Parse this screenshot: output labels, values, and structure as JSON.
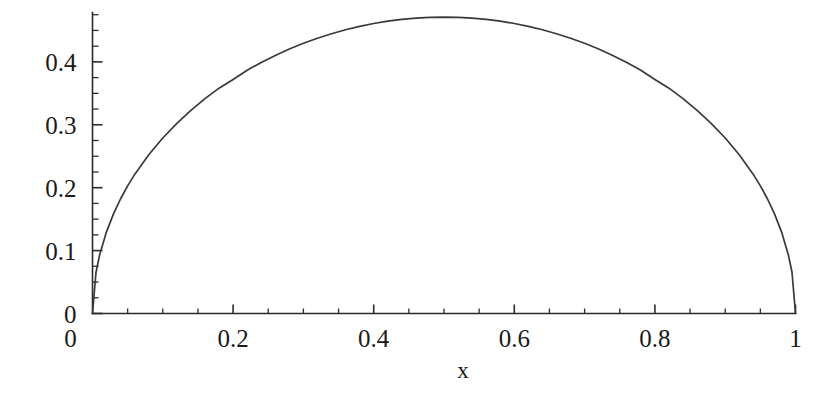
{
  "chart_data": {
    "type": "line",
    "title": "",
    "subtitle": "",
    "xlabel": "x",
    "ylabel": "",
    "xlim": [
      0,
      1
    ],
    "ylim": [
      0,
      0.475
    ],
    "grid": false,
    "legend": null,
    "x_ticks": [
      {
        "value": 0,
        "label": "0"
      },
      {
        "value": 0.2,
        "label": "0.2"
      },
      {
        "value": 0.4,
        "label": "0.4"
      },
      {
        "value": 0.6,
        "label": "0.6"
      },
      {
        "value": 0.8,
        "label": "0.8"
      },
      {
        "value": 1,
        "label": "1"
      }
    ],
    "y_ticks": [
      {
        "value": 0,
        "label": "0"
      },
      {
        "value": 0.1,
        "label": "0.1"
      },
      {
        "value": 0.2,
        "label": "0.2"
      },
      {
        "value": 0.3,
        "label": "0.3"
      },
      {
        "value": 0.4,
        "label": "0.4"
      }
    ],
    "x_minor_step": 0.05,
    "y_minor_step": 0.025,
    "series": [
      {
        "name": "curve",
        "color": "#3a3a3a",
        "x": [
          0,
          0.005,
          0.01,
          0.02,
          0.03,
          0.04,
          0.05,
          0.06,
          0.08,
          0.1,
          0.12,
          0.14,
          0.16,
          0.18,
          0.2,
          0.22,
          0.24,
          0.26,
          0.28,
          0.3,
          0.32,
          0.34,
          0.36,
          0.38,
          0.4,
          0.42,
          0.44,
          0.46,
          0.48,
          0.5,
          0.52,
          0.54,
          0.56,
          0.58,
          0.6,
          0.62,
          0.64,
          0.66,
          0.68,
          0.7,
          0.72,
          0.74,
          0.76,
          0.78,
          0.8,
          0.82,
          0.84,
          0.86,
          0.88,
          0.9,
          0.92,
          0.94,
          0.95,
          0.96,
          0.97,
          0.98,
          0.99,
          0.995,
          1
        ],
        "y": [
          0,
          0.0656,
          0.0925,
          0.1302,
          0.1587,
          0.1824,
          0.2029,
          0.2211,
          0.2523,
          0.279,
          0.3023,
          0.323,
          0.3415,
          0.3582,
          0.372,
          0.3867,
          0.3991,
          0.4103,
          0.4204,
          0.4295,
          0.4376,
          0.4448,
          0.4511,
          0.4565,
          0.461,
          0.4647,
          0.4676,
          0.4697,
          0.4709,
          0.4713,
          0.4709,
          0.4697,
          0.4676,
          0.4647,
          0.461,
          0.4565,
          0.4511,
          0.4448,
          0.4376,
          0.4295,
          0.4204,
          0.4103,
          0.3991,
          0.3867,
          0.372,
          0.3582,
          0.3415,
          0.323,
          0.3023,
          0.279,
          0.2523,
          0.2211,
          0.2029,
          0.1824,
          0.1587,
          0.1302,
          0.0925,
          0.0656,
          0
        ]
      }
    ]
  },
  "axes": {
    "x_axis_name": "x-axis",
    "y_axis_name": "y-axis"
  }
}
